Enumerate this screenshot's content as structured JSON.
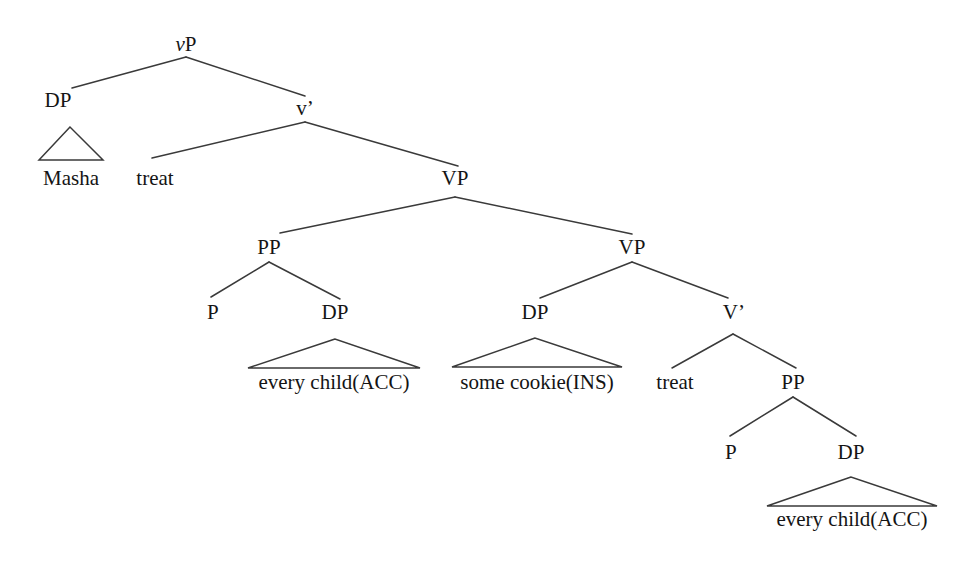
{
  "figure": {
    "kind": "syntax-tree",
    "background_color": "#ffffff",
    "line_color": "#3a3a3a",
    "text_color": "#141414"
  },
  "nodes": {
    "vp_root": "vP",
    "vp_root_italic_part": "v",
    "vp_root_upright_part": "P",
    "dp_subject": "DP",
    "v_bar": "v’",
    "vp_upper": "VP",
    "pp_left": "PP",
    "p_left": "P",
    "dp_left_object": "DP",
    "vp_lower": "VP",
    "dp_instrument": "DP",
    "v_bar_upper": "V’",
    "pp_right": "PP",
    "p_right": "P",
    "dp_right_object": "DP"
  },
  "leaves": {
    "masha": "Masha",
    "treat_upper": "treat",
    "every_child_acc_left": "every child(ACC)",
    "some_cookie_ins": "some cookie(INS)",
    "treat_lower": "treat",
    "every_child_acc_right": "every child(ACC)"
  }
}
